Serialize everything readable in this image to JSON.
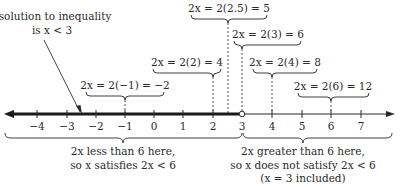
{
  "figure": {
    "title_annotation": {
      "line1": "solution to inequality",
      "line2": "is x < 3"
    },
    "axis": {
      "ticks": [
        {
          "value": -4,
          "label": "−4",
          "x": 37
        },
        {
          "value": -3,
          "label": "−3",
          "x": 67
        },
        {
          "value": -2,
          "label": "−2",
          "x": 96
        },
        {
          "value": -1,
          "label": "−1",
          "x": 125
        },
        {
          "value": 0,
          "label": "0",
          "x": 154
        },
        {
          "value": 1,
          "label": "1",
          "x": 183
        },
        {
          "value": 2,
          "label": "2",
          "x": 213
        },
        {
          "value": 3,
          "label": "3",
          "x": 242
        },
        {
          "value": 4,
          "label": "4",
          "x": 272
        },
        {
          "value": 5,
          "label": "5",
          "x": 302
        },
        {
          "value": 6,
          "label": "6",
          "x": 331
        },
        {
          "value": 7,
          "label": "7",
          "x": 361
        }
      ],
      "open_endpoint_value": 3,
      "shaded_direction": "left"
    },
    "evaluations": [
      {
        "id": "neg1",
        "text": "2x = 2(−1) = −2",
        "x_value": -1
      },
      {
        "id": "two",
        "text": "2x = 2(2) = 4",
        "x_value": 2
      },
      {
        "id": "twohalf",
        "text": "2x = 2(2.5) = 5",
        "x_value": 2.5
      },
      {
        "id": "three",
        "text": "2x = 2(3) = 6",
        "x_value": 3
      },
      {
        "id": "four",
        "text": "2x = 2(4) = 8",
        "x_value": 4
      },
      {
        "id": "six",
        "text": "2x = 2(6) = 12",
        "x_value": 6
      }
    ],
    "regions": {
      "left": {
        "line1": "2x less than 6 here,",
        "line2": "so x satisfies 2x < 6"
      },
      "right": {
        "line1": "2x greater than 6 here,",
        "line2": "so x does not satisfy 2x < 6",
        "line3": "(x = 3 included)"
      }
    },
    "colors": {
      "ink": "#2a2a2a",
      "background": "#ffffff"
    }
  }
}
